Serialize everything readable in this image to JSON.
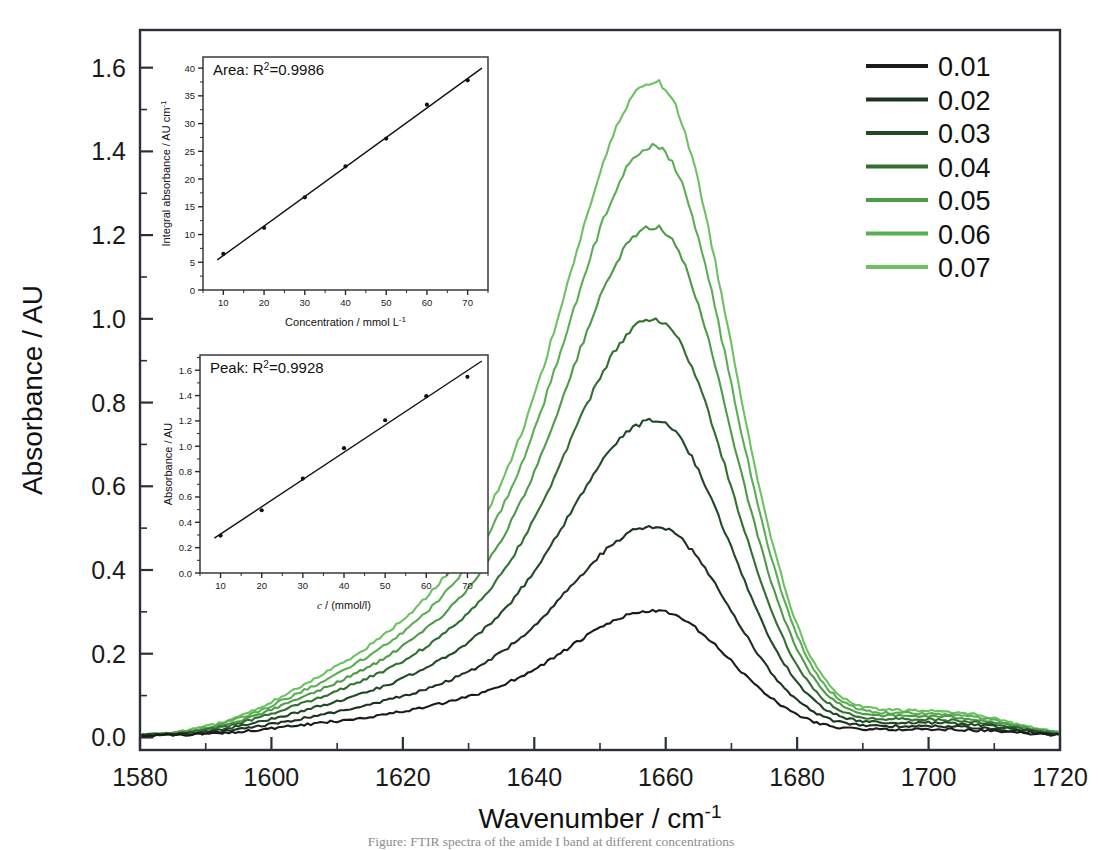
{
  "figure": {
    "background": "#ffffff",
    "caption_partial": "Figure: FTIR spectra of the amide I band at different concentrations"
  },
  "chart_data": {
    "type": "line",
    "title": "",
    "xlabel": "Wavenumber / cm-1",
    "xlabel_base": "Wavenumber / cm",
    "xlabel_exponent": "-1",
    "ylabel": "Absorbance / AU",
    "xlim": [
      1580,
      1720
    ],
    "ylim": [
      -0.03,
      1.69
    ],
    "xticks": [
      1580,
      1600,
      1620,
      1640,
      1660,
      1680,
      1700,
      1720
    ],
    "xtick_labels": [
      "1580",
      "1600",
      "1620",
      "1640",
      "1660",
      "1680",
      "1700",
      "1720"
    ],
    "x_minor_step": 10,
    "yticks": [
      0.0,
      0.2,
      0.4,
      0.6,
      0.8,
      1.0,
      1.2,
      1.4,
      1.6
    ],
    "ytick_labels": [
      "0.0",
      "0.2",
      "0.4",
      "0.6",
      "0.8",
      "1.0",
      "1.2",
      "1.4",
      "1.6"
    ],
    "y_minor_step": 0.1,
    "grid": false,
    "legend_position": "top-right",
    "peak_center": 1658.5,
    "shoulder_center": 1632,
    "minor_band_center": 1706,
    "series": [
      {
        "name": "0.01",
        "label": "0.01",
        "color": "#1b1b1b",
        "peak_absorbance": 0.295,
        "shoulder_absorbance": 0.042,
        "minor_band_absorbance": 0.012,
        "integral_absorbance": 6.5
      },
      {
        "name": "0.02",
        "label": "0.02",
        "color": "#1d3320",
        "peak_absorbance": 0.495,
        "shoulder_absorbance": 0.068,
        "minor_band_absorbance": 0.018,
        "integral_absorbance": 11.2
      },
      {
        "name": "0.03",
        "label": "0.03",
        "color": "#224a26",
        "peak_absorbance": 0.745,
        "shoulder_absorbance": 0.098,
        "minor_band_absorbance": 0.024,
        "integral_absorbance": 16.7
      },
      {
        "name": "0.04",
        "label": "0.04",
        "color": "#31702f",
        "peak_absorbance": 0.985,
        "shoulder_absorbance": 0.128,
        "minor_band_absorbance": 0.03,
        "integral_absorbance": 22.3
      },
      {
        "name": "0.05",
        "label": "0.05",
        "color": "#4e9b4a",
        "peak_absorbance": 1.205,
        "shoulder_absorbance": 0.152,
        "minor_band_absorbance": 0.036,
        "integral_absorbance": 27.3
      },
      {
        "name": "0.06",
        "label": "0.06",
        "color": "#5cae55",
        "peak_absorbance": 1.395,
        "shoulder_absorbance": 0.176,
        "minor_band_absorbance": 0.041,
        "integral_absorbance": 33.4
      },
      {
        "name": "0.07",
        "label": "0.07",
        "color": "#6dc162",
        "peak_absorbance": 1.548,
        "shoulder_absorbance": 0.198,
        "minor_band_absorbance": 0.046,
        "integral_absorbance": 37.8
      }
    ]
  },
  "legend": {
    "entries": [
      "0.01",
      "0.02",
      "0.03",
      "0.04",
      "0.05",
      "0.06",
      "0.07"
    ]
  },
  "inset_area": {
    "annotation_prefix": "Area: R",
    "annotation_exponent": "2",
    "annotation_suffix": "=0.9986",
    "annotation_full": "Area: R2=0.9986",
    "chart_data": {
      "type": "scatter",
      "xlabel_base": "Concentration / mmol L",
      "xlabel_exponent": "-1",
      "xlabel": "Concentration / mmol L-1",
      "ylabel_base": "Integral absorbance / AU cm",
      "ylabel_exponent": "-1",
      "ylabel": "Integral absorbance / AU cm-1",
      "xlim": [
        5,
        75
      ],
      "ylim": [
        0,
        42
      ],
      "xticks": [
        10,
        20,
        30,
        40,
        50,
        60,
        70
      ],
      "xtick_labels": [
        "10",
        "20",
        "30",
        "40",
        "50",
        "60",
        "70"
      ],
      "yticks": [
        0,
        5,
        10,
        15,
        20,
        25,
        30,
        35,
        40
      ],
      "ytick_labels": [
        "0",
        "5",
        "10",
        "15",
        "20",
        "25",
        "30",
        "35",
        "40"
      ],
      "x": [
        10,
        20,
        30,
        40,
        50,
        60,
        70
      ],
      "y": [
        6.5,
        11.2,
        16.7,
        22.3,
        27.3,
        33.4,
        37.8
      ],
      "fit_line": true,
      "r_squared": "0.9986"
    }
  },
  "inset_peak": {
    "annotation_prefix": "Peak: R",
    "annotation_exponent": "2",
    "annotation_suffix": "=0.9928",
    "annotation_full": "Peak: R2=0.9928",
    "chart_data": {
      "type": "scatter",
      "xlabel_italic": "c",
      "xlabel_rest": " / (mmol/l)",
      "xlabel": "c / (mmol/l)",
      "ylabel": "Absorbance / AU",
      "xlim": [
        5,
        75
      ],
      "ylim": [
        0,
        1.72
      ],
      "xticks": [
        10,
        20,
        30,
        40,
        50,
        60,
        70
      ],
      "xtick_labels": [
        "10",
        "20",
        "30",
        "40",
        "50",
        "60",
        "70"
      ],
      "yticks": [
        0.0,
        0.2,
        0.4,
        0.6,
        0.8,
        1.0,
        1.2,
        1.4,
        1.6
      ],
      "ytick_labels": [
        "0.0",
        "0.2",
        "0.4",
        "0.6",
        "0.8",
        "1.0",
        "1.2",
        "1.4",
        "1.6"
      ],
      "x": [
        10,
        20,
        30,
        40,
        50,
        60,
        70
      ],
      "y": [
        0.295,
        0.495,
        0.745,
        0.985,
        1.205,
        1.395,
        1.548
      ],
      "fit_line": true,
      "r_squared": "0.9928"
    }
  }
}
